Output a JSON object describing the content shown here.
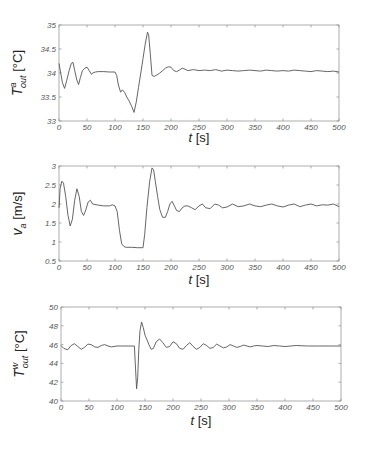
{
  "chart_data": [
    {
      "type": "line",
      "title": "",
      "xlabel": "t [s]",
      "ylabel": "T^a_out [°C]",
      "ylabel_parts": {
        "main": "T",
        "sup": "a",
        "sub": "out",
        "unit": " [°C]"
      },
      "xlim": [
        0,
        500
      ],
      "ylim": [
        33,
        35
      ],
      "xticks": [
        0,
        50,
        100,
        150,
        200,
        250,
        300,
        350,
        400,
        450,
        500
      ],
      "yticks": [
        33,
        33.5,
        34,
        34.5,
        35
      ],
      "ytick_labels": [
        "33",
        "33.5",
        "34",
        "34.5",
        "35"
      ],
      "grid": false,
      "legend": null,
      "series": [
        {
          "name": "T_out^a",
          "x": [
            0,
            3,
            6,
            10,
            14,
            18,
            22,
            25,
            28,
            32,
            35,
            38,
            42,
            46,
            50,
            54,
            58,
            60,
            65,
            70,
            80,
            90,
            100,
            103,
            106,
            110,
            113,
            117,
            121,
            125,
            130,
            134,
            138,
            142,
            146,
            150,
            154,
            158,
            160,
            163,
            166,
            170,
            175,
            180,
            185,
            190,
            195,
            200,
            205,
            210,
            215,
            220,
            225,
            230,
            240,
            250,
            260,
            270,
            280,
            290,
            300,
            310,
            320,
            330,
            340,
            350,
            360,
            370,
            380,
            390,
            400,
            410,
            420,
            430,
            440,
            450,
            460,
            470,
            480,
            490,
            500
          ],
          "y": [
            34.2,
            34.0,
            33.8,
            33.68,
            33.85,
            34.05,
            34.2,
            34.22,
            34.05,
            33.85,
            33.76,
            33.9,
            34.05,
            34.1,
            34.12,
            34.05,
            33.97,
            34.0,
            34.02,
            34.03,
            34.03,
            34.02,
            34.02,
            33.95,
            33.75,
            33.6,
            33.65,
            33.6,
            33.5,
            33.42,
            33.3,
            33.18,
            33.4,
            33.7,
            34.0,
            34.3,
            34.6,
            34.85,
            34.8,
            34.4,
            33.95,
            33.93,
            33.96,
            34.0,
            34.05,
            34.1,
            34.13,
            34.12,
            34.05,
            34.03,
            34.06,
            34.1,
            34.08,
            34.05,
            34.07,
            34.05,
            34.06,
            34.05,
            34.07,
            34.04,
            34.06,
            34.05,
            34.04,
            34.05,
            34.06,
            34.05,
            34.04,
            34.06,
            34.05,
            34.04,
            34.05,
            34.04,
            34.06,
            34.05,
            34.04,
            34.03,
            34.05,
            34.04,
            34.03,
            34.04,
            34.02
          ]
        }
      ]
    },
    {
      "type": "line",
      "title": "",
      "xlabel": "t [s]",
      "ylabel": "v_a [m/s]",
      "ylabel_parts": {
        "main": "v",
        "sup": "",
        "sub": "a",
        "unit": " [m/s]"
      },
      "xlim": [
        0,
        500
      ],
      "ylim": [
        0.5,
        3
      ],
      "xticks": [
        0,
        50,
        100,
        150,
        200,
        250,
        300,
        350,
        400,
        450,
        500
      ],
      "yticks": [
        0.5,
        1,
        1.5,
        2,
        2.5,
        3
      ],
      "ytick_labels": [
        "0.5",
        "1",
        "1.5",
        "2",
        "2.5",
        "3"
      ],
      "grid": false,
      "legend": null,
      "series": [
        {
          "name": "v_a",
          "x": [
            0,
            2,
            5,
            8,
            12,
            16,
            20,
            24,
            28,
            32,
            36,
            40,
            44,
            48,
            52,
            56,
            60,
            70,
            80,
            90,
            95,
            100,
            104,
            108,
            112,
            116,
            120,
            130,
            140,
            150,
            153,
            157,
            162,
            166,
            169,
            172,
            176,
            180,
            185,
            190,
            194,
            198,
            202,
            206,
            210,
            215,
            220,
            225,
            230,
            237,
            243,
            250,
            256,
            262,
            270,
            278,
            285,
            292,
            300,
            310,
            320,
            330,
            340,
            350,
            360,
            370,
            380,
            390,
            400,
            410,
            420,
            430,
            440,
            450,
            460,
            470,
            480,
            490,
            500
          ],
          "y": [
            1.9,
            2.4,
            2.6,
            2.55,
            2.2,
            1.7,
            1.42,
            1.6,
            2.1,
            2.4,
            2.2,
            1.8,
            1.7,
            1.85,
            2.05,
            2.1,
            2.0,
            1.97,
            1.95,
            1.95,
            1.98,
            1.95,
            1.8,
            1.3,
            0.95,
            0.88,
            0.86,
            0.86,
            0.85,
            0.85,
            1.2,
            1.9,
            2.6,
            2.95,
            2.9,
            2.6,
            2.2,
            1.85,
            1.65,
            1.65,
            1.8,
            2.0,
            2.07,
            1.95,
            1.83,
            1.8,
            1.9,
            1.95,
            1.95,
            1.9,
            1.85,
            1.95,
            2.0,
            1.9,
            1.88,
            2.0,
            1.97,
            1.9,
            1.92,
            2.0,
            1.93,
            1.95,
            2.0,
            1.95,
            1.93,
            1.97,
            2.0,
            1.95,
            1.92,
            1.97,
            2.0,
            1.93,
            1.97,
            2.0,
            1.95,
            1.98,
            1.97,
            2.0,
            1.93
          ]
        }
      ]
    },
    {
      "type": "line",
      "title": "",
      "xlabel": "t [s]",
      "ylabel": "T^w_out [°C]",
      "ylabel_parts": {
        "main": "T",
        "sup": "w",
        "sub": "out",
        "unit": " [°C]"
      },
      "xlim": [
        0,
        500
      ],
      "ylim": [
        40,
        50
      ],
      "xticks": [
        0,
        50,
        100,
        150,
        200,
        250,
        300,
        350,
        400,
        450,
        500
      ],
      "yticks": [
        40,
        42,
        44,
        46,
        48,
        50
      ],
      "ytick_labels": [
        "40",
        "42",
        "44",
        "46",
        "48",
        "50"
      ],
      "grid": false,
      "legend": null,
      "series": [
        {
          "name": "T_out^w",
          "x": [
            0,
            5,
            12,
            18,
            24,
            30,
            36,
            42,
            48,
            54,
            60,
            66,
            72,
            78,
            84,
            90,
            100,
            110,
            120,
            130,
            131,
            133,
            135,
            137,
            139,
            141,
            144,
            147,
            150,
            153,
            157,
            161,
            165,
            170,
            176,
            182,
            188,
            194,
            200,
            206,
            212,
            218,
            224,
            230,
            236,
            242,
            248,
            254,
            260,
            266,
            272,
            278,
            284,
            290,
            296,
            302,
            308,
            314,
            320,
            326,
            332,
            338,
            344,
            350,
            360,
            370,
            380,
            390,
            400,
            420,
            440,
            460,
            480,
            500
          ],
          "y": [
            45.9,
            45.6,
            45.45,
            45.9,
            46.1,
            45.8,
            45.5,
            45.7,
            46.05,
            46.0,
            45.75,
            45.7,
            45.9,
            46.0,
            45.85,
            45.75,
            45.85,
            45.85,
            45.85,
            45.85,
            45.85,
            43.5,
            41.3,
            42.5,
            45.5,
            47.5,
            48.4,
            47.8,
            47.0,
            46.6,
            46.0,
            45.5,
            45.6,
            46.3,
            46.6,
            46.2,
            45.7,
            45.8,
            46.3,
            46.1,
            45.6,
            45.5,
            45.9,
            46.2,
            45.8,
            45.5,
            45.7,
            46.1,
            45.9,
            45.6,
            45.7,
            46.05,
            45.85,
            45.65,
            45.75,
            46.0,
            45.85,
            45.7,
            45.8,
            45.95,
            45.85,
            45.75,
            45.85,
            45.9,
            45.85,
            45.8,
            45.9,
            45.85,
            45.8,
            45.9,
            45.85,
            45.85,
            45.85,
            45.85
          ]
        }
      ]
    }
  ],
  "layout": {
    "panels": [
      {
        "x0": 59,
        "x1": 339,
        "y0": 25,
        "y1": 121,
        "xlabel_y": 142,
        "ylabel_x": 22
      },
      {
        "x0": 59,
        "x1": 339,
        "y0": 166,
        "y1": 261,
        "xlabel_y": 284,
        "ylabel_x": 22
      },
      {
        "x0": 61,
        "x1": 341,
        "y0": 307,
        "y1": 401,
        "xlabel_y": 425,
        "ylabel_x": 24
      }
    ],
    "line_color": "#555555",
    "frame_color": "#9a9a9a"
  }
}
